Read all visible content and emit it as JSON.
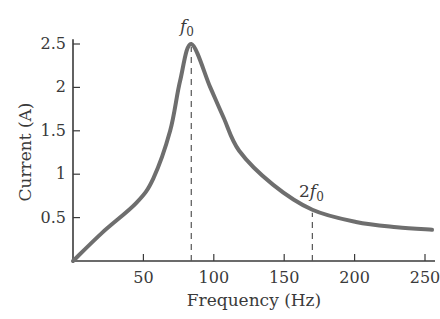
{
  "chart_data": {
    "type": "line",
    "title": "",
    "xlabel": "Frequency (Hz)",
    "ylabel": "Current (A)",
    "xlim": [
      0,
      260
    ],
    "ylim": [
      0,
      2.6
    ],
    "grid": false,
    "legend": null,
    "xticks": [
      50,
      100,
      150,
      200,
      250
    ],
    "xtick_labels": [
      "50",
      "100",
      "150",
      "200",
      "250"
    ],
    "yticks": [
      0.5,
      1,
      1.5,
      2,
      2.5
    ],
    "ytick_labels": [
      "0.5",
      "1",
      "1.5",
      "2",
      "2.5"
    ],
    "series": [
      {
        "name": "Resonance curve",
        "color": "#6e6e6e",
        "x": [
          0,
          21,
          45,
          57,
          69,
          76,
          84,
          97.5,
          107,
          118,
          142,
          170,
          201,
          230,
          255
        ],
        "y": [
          0,
          0.33,
          0.67,
          0.95,
          1.5,
          2.07,
          2.5,
          2.0,
          1.65,
          1.27,
          0.88,
          0.59,
          0.45,
          0.39,
          0.36
        ]
      }
    ],
    "annotations": [
      {
        "label_main": "f",
        "label_sub": "0",
        "x": 84,
        "y": 2.5,
        "type": "dashed-vline"
      },
      {
        "label_prefix": "2",
        "label_main": "f",
        "label_sub": "0",
        "x": 170,
        "y": 0.59,
        "type": "dashed-vline"
      }
    ]
  },
  "labels": {
    "xlabel": "Frequency (Hz)",
    "ylabel": "Current (A)",
    "f0_main": "f",
    "f0_sub": "0",
    "twof0_prefix": "2",
    "twof0_main": "f",
    "twof0_sub": "0"
  }
}
